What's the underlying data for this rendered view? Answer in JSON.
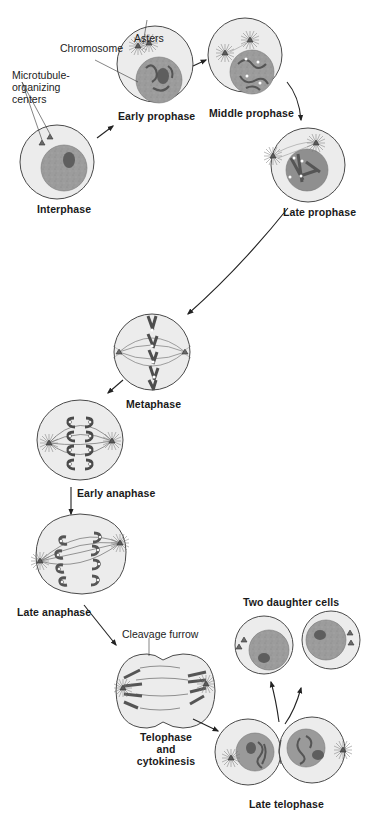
{
  "diagram": {
    "colors": {
      "cell_fill": "#ececec",
      "cell_outline": "#4a4a4a",
      "nucleus_fill": "#9a9a9a",
      "nucleolus_fill": "#5e5e5e",
      "chromosome_fill": "#6a6a6a",
      "arrow": "#222222",
      "background": "#ffffff"
    },
    "stages": [
      {
        "id": "interphase",
        "label": "Interphase"
      },
      {
        "id": "early-prophase",
        "label": "Early prophase"
      },
      {
        "id": "middle-prophase",
        "label": "Middle prophase"
      },
      {
        "id": "late-prophase",
        "label": "Late prophase"
      },
      {
        "id": "metaphase",
        "label": "Metaphase"
      },
      {
        "id": "early-anaphase",
        "label": "Early anaphase"
      },
      {
        "id": "late-anaphase",
        "label": "Late anaphase"
      },
      {
        "id": "telophase",
        "label_line1": "Telophase",
        "label_line2": "and",
        "label_line3": "cytokinesis"
      },
      {
        "id": "late-telophase",
        "label": "Late telophase"
      },
      {
        "id": "daughter-cells",
        "label": "Two daughter cells"
      }
    ],
    "annotations": {
      "mtoc_line1": "Microtubule-",
      "mtoc_line2": "organizing",
      "mtoc_line3": "centers",
      "chromosome": "Chromosome",
      "asters": "Asters",
      "cleavage_furrow": "Cleavage furrow"
    },
    "flow": [
      "Interphase",
      "Early prophase",
      "Middle prophase",
      "Late prophase",
      "Metaphase",
      "Early anaphase",
      "Late anaphase",
      "Telophase and cytokinesis",
      "Late telophase",
      "Two daughter cells"
    ]
  }
}
